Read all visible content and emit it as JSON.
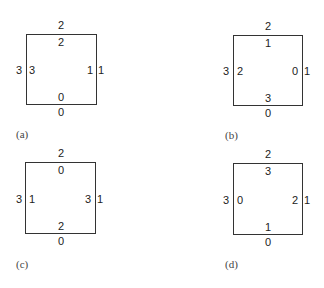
{
  "figure": {
    "panels": [
      {
        "caption": "(a)",
        "outer": {
          "top": "2",
          "left": "3",
          "right": "1",
          "bottom": "0"
        },
        "inner": {
          "top": "2",
          "left": "3",
          "right": "1",
          "bottom": "0"
        }
      },
      {
        "caption": "(b)",
        "outer": {
          "top": "2",
          "left": "3",
          "right": "1",
          "bottom": "0"
        },
        "inner": {
          "top": "1",
          "left": "2",
          "right": "0",
          "bottom": "3"
        }
      },
      {
        "caption": "(c)",
        "outer": {
          "top": "2",
          "left": "3",
          "right": "1",
          "bottom": "0"
        },
        "inner": {
          "top": "0",
          "left": "1",
          "right": "3",
          "bottom": "2"
        }
      },
      {
        "caption": "(d)",
        "outer": {
          "top": "2",
          "left": "3",
          "right": "1",
          "bottom": "0"
        },
        "inner": {
          "top": "3",
          "left": "0",
          "right": "2",
          "bottom": "1"
        }
      }
    ]
  }
}
